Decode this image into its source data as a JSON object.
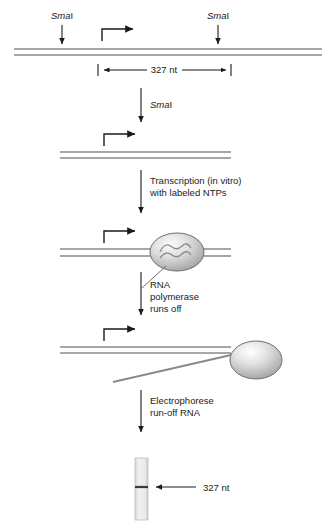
{
  "figure": {
    "background_color": "#ffffff",
    "dna_strand_color": "#8a8a8a",
    "arrow_color": "#1a1a1a",
    "text_color": "#1a1a1a",
    "protein_fill_light": "#f2f2f2",
    "protein_fill_dark": "#9a9a9a",
    "gel_lane_color": "#e8e8e8",
    "gel_band_color": "#3a3a3a"
  },
  "labels": {
    "enzyme_left": {
      "italic": "Sma",
      "roman": "I"
    },
    "enzyme_right": {
      "italic": "Sma",
      "roman": "I"
    },
    "enzyme_digest": {
      "italic": "Sma",
      "roman": "I"
    },
    "length_top": "327 nt",
    "length_gel": "327 nt"
  },
  "steps": [
    {
      "id": "transcription",
      "line1": "Transcription (in vitro)",
      "line2": "with labeled NTPs"
    },
    {
      "id": "runoff",
      "line1": "RNA",
      "line2": "polymerase",
      "line3": "runs off"
    },
    {
      "id": "electrophorese",
      "line1": "Electrophorese",
      "line2": "run-off RNA"
    }
  ],
  "elements": {
    "promoter_arrow_name": "promoter-transcription-start-arrow",
    "polymerase_name": "rna-polymerase",
    "rna_transcript_name": "rna-transcript",
    "gel_lane_name": "gel-lane",
    "gel_band_name": "gel-band-327nt"
  }
}
